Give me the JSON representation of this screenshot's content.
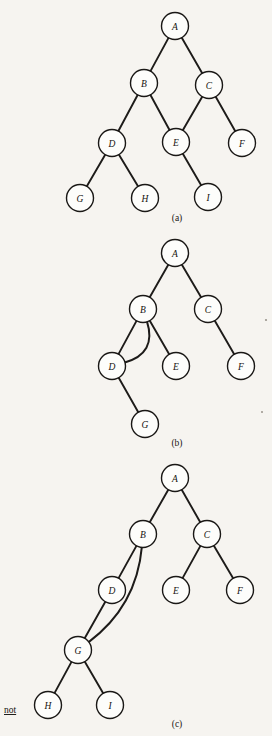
{
  "figure": {
    "background_color": "#f6f4f0",
    "node_fill": "#fdfdfb",
    "node_stroke": "#1a1816",
    "edge_color": "#1d1b19",
    "node_radius": 13.5,
    "side_note": "not"
  },
  "diagrams": [
    {
      "id": "a",
      "caption": "(a)",
      "caption_pos": {
        "x": 177,
        "y": 221
      },
      "nodes": [
        {
          "id": "A",
          "label": "A",
          "x": 175,
          "y": 26
        },
        {
          "id": "B",
          "label": "B",
          "x": 144,
          "y": 83
        },
        {
          "id": "C",
          "label": "C",
          "x": 209,
          "y": 85
        },
        {
          "id": "D",
          "label": "D",
          "x": 112,
          "y": 143
        },
        {
          "id": "E",
          "label": "E",
          "x": 176,
          "y": 142
        },
        {
          "id": "F",
          "label": "F",
          "x": 242,
          "y": 143
        },
        {
          "id": "G",
          "label": "G",
          "x": 80,
          "y": 198
        },
        {
          "id": "H",
          "label": "H",
          "x": 145,
          "y": 198
        },
        {
          "id": "I",
          "label": "I",
          "x": 208,
          "y": 197
        }
      ],
      "edges": [
        {
          "from": "A",
          "to": "B",
          "type": "line"
        },
        {
          "from": "A",
          "to": "C",
          "type": "line"
        },
        {
          "from": "B",
          "to": "D",
          "type": "line"
        },
        {
          "from": "B",
          "to": "E",
          "type": "line"
        },
        {
          "from": "C",
          "to": "E",
          "type": "line"
        },
        {
          "from": "C",
          "to": "F",
          "type": "line"
        },
        {
          "from": "D",
          "to": "G",
          "type": "line"
        },
        {
          "from": "D",
          "to": "H",
          "type": "line"
        },
        {
          "from": "E",
          "to": "I",
          "type": "line"
        }
      ]
    },
    {
      "id": "b",
      "caption": "(b)",
      "caption_pos": {
        "x": 177,
        "y": 446
      },
      "nodes": [
        {
          "id": "A",
          "label": "A",
          "x": 175,
          "y": 253
        },
        {
          "id": "B",
          "label": "B",
          "x": 143,
          "y": 309
        },
        {
          "id": "C",
          "label": "C",
          "x": 208,
          "y": 309
        },
        {
          "id": "D",
          "label": "D",
          "x": 112,
          "y": 366
        },
        {
          "id": "E",
          "label": "E",
          "x": 176,
          "y": 366
        },
        {
          "id": "F",
          "label": "F",
          "x": 241,
          "y": 366
        },
        {
          "id": "G",
          "label": "G",
          "x": 145,
          "y": 424
        }
      ],
      "edges": [
        {
          "from": "A",
          "to": "B",
          "type": "line"
        },
        {
          "from": "A",
          "to": "C",
          "type": "line"
        },
        {
          "from": "B",
          "to": "D",
          "type": "line"
        },
        {
          "from": "B",
          "to": "E",
          "type": "line"
        },
        {
          "from": "C",
          "to": "F",
          "type": "line"
        },
        {
          "from": "D",
          "to": "G",
          "type": "line"
        },
        {
          "from": "B",
          "to": "D",
          "type": "curve",
          "note": "cycle-edge"
        }
      ]
    },
    {
      "id": "c",
      "caption": "(c)",
      "caption_pos": {
        "x": 177,
        "y": 727
      },
      "nodes": [
        {
          "id": "A",
          "label": "A",
          "x": 175,
          "y": 478
        },
        {
          "id": "B",
          "label": "B",
          "x": 143,
          "y": 534
        },
        {
          "id": "C",
          "label": "C",
          "x": 207,
          "y": 534
        },
        {
          "id": "D",
          "label": "D",
          "x": 112,
          "y": 590
        },
        {
          "id": "E",
          "label": "E",
          "x": 176,
          "y": 590
        },
        {
          "id": "F",
          "label": "F",
          "x": 240,
          "y": 590
        },
        {
          "id": "G",
          "label": "G",
          "x": 78,
          "y": 650
        },
        {
          "id": "H",
          "label": "H",
          "x": 48,
          "y": 705
        },
        {
          "id": "I",
          "label": "I",
          "x": 110,
          "y": 705
        }
      ],
      "edges": [
        {
          "from": "A",
          "to": "B",
          "type": "line"
        },
        {
          "from": "A",
          "to": "C",
          "type": "line"
        },
        {
          "from": "B",
          "to": "D",
          "type": "line"
        },
        {
          "from": "C",
          "to": "E",
          "type": "line"
        },
        {
          "from": "C",
          "to": "F",
          "type": "line"
        },
        {
          "from": "D",
          "to": "G",
          "type": "line"
        },
        {
          "from": "G",
          "to": "H",
          "type": "line"
        },
        {
          "from": "G",
          "to": "I",
          "type": "line"
        },
        {
          "from": "B",
          "to": "G",
          "type": "curve",
          "note": "cycle-edge"
        }
      ]
    }
  ]
}
